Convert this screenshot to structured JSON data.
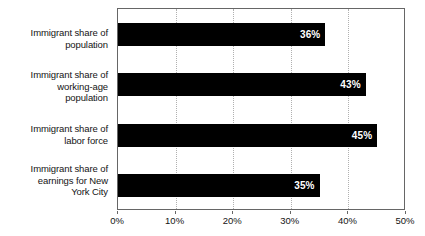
{
  "chart_data": {
    "type": "bar",
    "orientation": "horizontal",
    "title": "",
    "subtitle": "",
    "xlabel": "",
    "ylabel": "",
    "categories": [
      "Immigrant share of population",
      "Immigrant share of working-age population",
      "Immigrant share of labor force",
      "Immigrant share of earnings for New York City"
    ],
    "category_lines": [
      [
        "Immigrant share of",
        "population"
      ],
      [
        "Immigrant share of",
        "working-age",
        "population"
      ],
      [
        "Immigrant share of",
        "labor force"
      ],
      [
        "Immigrant share of",
        "earnings for New",
        "York City"
      ]
    ],
    "values": [
      36,
      43,
      45,
      35
    ],
    "data_labels": [
      "36%",
      "43%",
      "45%",
      "35%"
    ],
    "xlim": [
      0,
      50
    ],
    "xticks": [
      0,
      10,
      20,
      30,
      40,
      50
    ],
    "xticklabels": [
      "0%",
      "10%",
      "20%",
      "30%",
      "40%",
      "50%"
    ],
    "grid": true,
    "grid_axis": "x",
    "grid_style": "dotted",
    "legend": false,
    "legend_position": "none",
    "bar_color": "#000000",
    "data_label_color": "#FFFFFF",
    "gridline_color": "#B0B0B0",
    "axis_color": "#666666",
    "background_color": "#FFFFFF"
  }
}
